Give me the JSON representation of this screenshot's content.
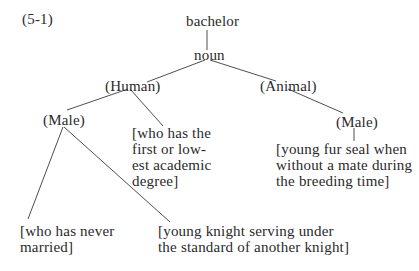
{
  "diagram": {
    "label": "(5-1)",
    "nodes": {
      "root": "bachelor",
      "pos": "noun",
      "human": "(Human)",
      "animal": "(Animal)",
      "human_male": "(Male)",
      "animal_male": "(Male)"
    },
    "definitions": {
      "academic": "[who has the\nfirst or low-\nest academic\ndegree]",
      "never_married": "[who has never\nmarried]",
      "knight": "[young knight serving under\nthe standard of another knight]",
      "fur_seal": "[young fur seal when\nwithout a mate during\nthe breeding time]"
    },
    "edges": [
      [
        "bachelor",
        "noun"
      ],
      [
        "noun",
        "(Human)"
      ],
      [
        "noun",
        "(Animal)"
      ],
      [
        "(Human)",
        "(Male)"
      ],
      [
        "(Human)",
        "[who has the first or lowest academic degree]"
      ],
      [
        "(Human)/(Male)",
        "[who has never married]"
      ],
      [
        "(Human)/(Male)",
        "[young knight serving under the standard of another knight]"
      ],
      [
        "(Animal)",
        "(Male)"
      ],
      [
        "(Animal)/(Male)",
        "[young fur seal when without a mate during the breeding time]"
      ]
    ]
  }
}
